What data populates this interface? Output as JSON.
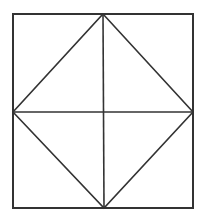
{
  "figure": {
    "name": "square-with-inscribed-diamond-and-medians",
    "description": "Geometric line drawing: a square containing an inscribed diamond whose vertices touch the midpoints of the square's sides, plus horizontal and vertical median lines through the center, dividing the figure into eight triangles.",
    "background_color": "#ffffff",
    "line_color": "#333333",
    "outer_stroke_width": 2,
    "inner_stroke_width": 1.6,
    "canvas": {
      "width": 203,
      "height": 216
    },
    "square": {
      "label": "outer-square",
      "left": 13,
      "top": 14,
      "right": 193,
      "bottom": 208,
      "width": 180,
      "height": 194
    },
    "points": {
      "top_left": {
        "x": 13,
        "y": 14
      },
      "top_right": {
        "x": 193,
        "y": 14
      },
      "bottom_right": {
        "x": 193,
        "y": 208
      },
      "bottom_left": {
        "x": 13,
        "y": 208
      },
      "top_mid": {
        "x": 103,
        "y": 14
      },
      "right_mid": {
        "x": 193,
        "y": 112
      },
      "bottom_mid": {
        "x": 104,
        "y": 208
      },
      "left_mid": {
        "x": 13,
        "y": 112
      },
      "center": {
        "x": 104,
        "y": 112
      }
    },
    "diamond": {
      "label": "inscribed-diamond",
      "vertices": [
        {
          "x": 103,
          "y": 14
        },
        {
          "x": 193,
          "y": 112
        },
        {
          "x": 104,
          "y": 208
        },
        {
          "x": 13,
          "y": 112
        }
      ]
    },
    "medians": {
      "horizontal": {
        "x1": 13,
        "y1": 112,
        "x2": 193,
        "y2": 112
      },
      "vertical": {
        "x1": 103,
        "y1": 14,
        "x2": 104,
        "y2": 208
      }
    }
  }
}
